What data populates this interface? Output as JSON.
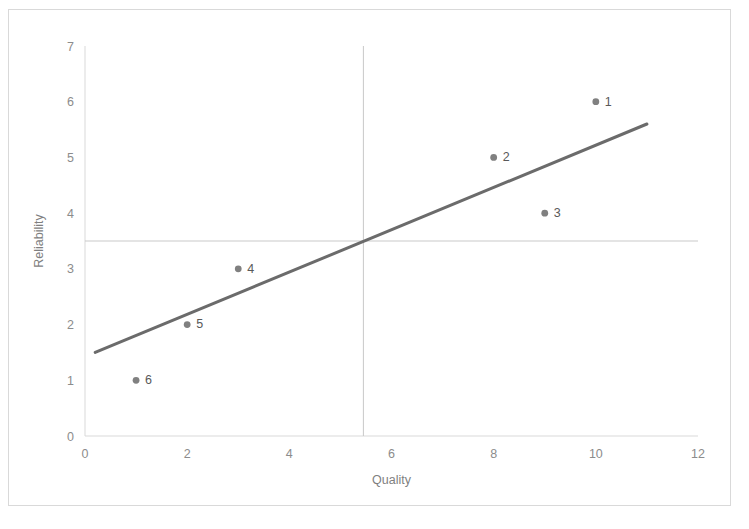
{
  "chart_data": {
    "type": "scatter",
    "title": "",
    "xlabel": "Quality",
    "ylabel": "Reliability",
    "xlim": [
      0,
      12
    ],
    "ylim": [
      0,
      7
    ],
    "xticks": [
      0,
      2,
      4,
      6,
      8,
      10,
      12
    ],
    "yticks": [
      0,
      1,
      2,
      3,
      4,
      5,
      6,
      7
    ],
    "grid": false,
    "legend": "none",
    "point_labels": [
      "1",
      "2",
      "3",
      "4",
      "5",
      "6"
    ],
    "x": [
      10,
      8,
      9,
      3,
      2,
      1
    ],
    "y": [
      6,
      5,
      4,
      3,
      2,
      1
    ],
    "points": [
      {
        "label": "1",
        "x": 10,
        "y": 6
      },
      {
        "label": "2",
        "x": 8,
        "y": 5
      },
      {
        "label": "3",
        "x": 9,
        "y": 4
      },
      {
        "label": "4",
        "x": 3,
        "y": 3
      },
      {
        "label": "5",
        "x": 2,
        "y": 2
      },
      {
        "label": "6",
        "x": 1,
        "y": 1
      }
    ],
    "trendline": {
      "type": "linear",
      "x_start": 0.2,
      "y_start": 1.5,
      "x_end": 11.0,
      "y_end": 5.6,
      "color": "#6b6b6b"
    },
    "reference_lines": [
      {
        "orientation": "horizontal",
        "value": 3.5,
        "axis": "y",
        "color": "#c9c9c9"
      },
      {
        "orientation": "vertical",
        "value": 5.45,
        "axis": "x",
        "color": "#c9c9c9"
      }
    ],
    "colors": {
      "marker": "#808080",
      "axis": "#d9d9d9",
      "tick_text": "#8c8c8c",
      "label_text": "#595959",
      "frame": "#d9d9d9"
    }
  }
}
